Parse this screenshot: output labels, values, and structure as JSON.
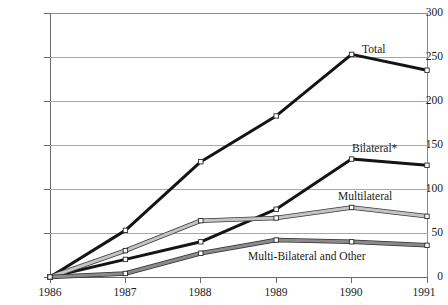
{
  "chart_data": {
    "type": "line",
    "title": "",
    "xlabel": "",
    "ylabel": "",
    "categories": [
      "1986",
      "1987",
      "1988",
      "1989",
      "1990",
      "1991"
    ],
    "ylim": [
      0,
      300
    ],
    "yticks": [
      0,
      50,
      100,
      150,
      200,
      250,
      300
    ],
    "grid": "horizontal",
    "legend": "in-plot labels at right of each series",
    "series": [
      {
        "name": "Total",
        "values": [
          0,
          53,
          131,
          183,
          253,
          235
        ],
        "color": "#141414",
        "style": "thick-black-line"
      },
      {
        "name": "Bilateral*",
        "values": [
          0,
          20,
          40,
          77,
          134,
          127
        ],
        "color": "#141414",
        "style": "thick-black-line"
      },
      {
        "name": "Multilateral",
        "values": [
          0,
          30,
          64,
          67,
          79,
          69
        ],
        "color": "#b4b4b4",
        "style": "light-gray-band"
      },
      {
        "name": "Multi-Bilateral and Other",
        "values": [
          0,
          4,
          27,
          42,
          40,
          36
        ],
        "color": "#7d7d7d",
        "style": "medium-gray-band"
      }
    ]
  },
  "axes": {
    "ytick_labels": [
      "300",
      "250",
      "200",
      "150",
      "100",
      "50",
      "0"
    ],
    "xtick_labels": [
      "1986",
      "1987",
      "1988",
      "1989",
      "1990",
      "1991"
    ]
  },
  "labels": {
    "total": "Total",
    "bilateral": "Bilateral*",
    "multilateral": "Multilateral",
    "multi_bilateral": "Multi-Bilateral and Other"
  },
  "colors": {
    "axis": "#6a6a6a",
    "gridline": "#a9a9a9",
    "frame": "#8a8a8a",
    "marker_fill": "#ffffff",
    "text": "#1a1a1a"
  }
}
